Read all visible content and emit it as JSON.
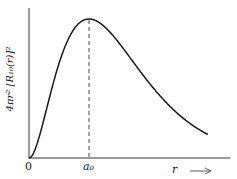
{
  "chart_data": {
    "type": "line",
    "title": "",
    "xlabel": "r",
    "ylabel": "4πr² [R₁₀(r)]²",
    "ylabel_parts": {
      "main": "4πr²",
      "bracket": "[R₁₀(r)]²"
    },
    "x_ticks": [
      {
        "label": "0",
        "value": 0
      },
      {
        "label": "a₀",
        "value": 1
      }
    ],
    "x_units": "a₀",
    "xlim": [
      0,
      3.35
    ],
    "ylim": [
      0,
      1.08
    ],
    "grid": false,
    "legend": null,
    "annotations": [
      {
        "type": "dashed-vertical-line",
        "x": 1,
        "description": "Maximum of radial probability at r = a₀"
      }
    ],
    "function": "(r/a₀)² · exp(2 − 2r/a₀)  (normalized radial probability density, hydrogen 1s)",
    "series": [
      {
        "name": "4πr²[R₁₀(r)]²",
        "x": [
          0,
          0.25,
          0.5,
          0.75,
          1.0,
          1.25,
          1.5,
          1.75,
          2.0,
          2.25,
          2.5,
          2.75,
          3.0
        ],
        "values": [
          0,
          0.14,
          0.37,
          0.62,
          1.0,
          0.95,
          0.83,
          0.69,
          0.54,
          0.41,
          0.31,
          0.23,
          0.17
        ]
      }
    ]
  },
  "labels": {
    "origin": "0",
    "a0": "a₀",
    "x_axis": "r",
    "x_arrow": "⟶",
    "y_axis": "4πr² [R₁₀(r)]²"
  }
}
